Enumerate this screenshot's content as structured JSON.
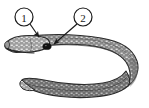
{
  "figure": {
    "type": "scientific-illustration",
    "background_color": "#ffffff",
    "body_fill_color": "#8a8a8a",
    "body_outline_color": "#2b2b2b",
    "speckle_color": "#e8e8e8",
    "shadow_color": "#5a5a5a",
    "eye_color": "#111111",
    "label_text_color": "#1a1a1a",
    "label_circle_fill": "#ffffff",
    "label_circle_stroke": "#1a1a1a"
  },
  "callouts": [
    {
      "id": "callout-1",
      "label": "1",
      "circle_cx": 24,
      "circle_cy": 17,
      "circle_r": 9,
      "leader_x1": 30,
      "leader_y1": 24,
      "leader_x2": 39,
      "leader_y2": 37,
      "arrow_tip_x": 40,
      "arrow_tip_y": 39,
      "target": "head-dorsal-surface"
    },
    {
      "id": "callout-2",
      "label": "2",
      "circle_cx": 83,
      "circle_cy": 17,
      "circle_r": 9,
      "leader_x1": 77,
      "leader_y1": 24,
      "leader_x2": 54,
      "leader_y2": 44,
      "arrow_tip_x": 52,
      "arrow_tip_y": 46,
      "target": "eye"
    }
  ],
  "anatomy": {
    "head_label": "head",
    "eye_label": "eye",
    "mouth_label": "mouth",
    "tail_label": "tail"
  }
}
